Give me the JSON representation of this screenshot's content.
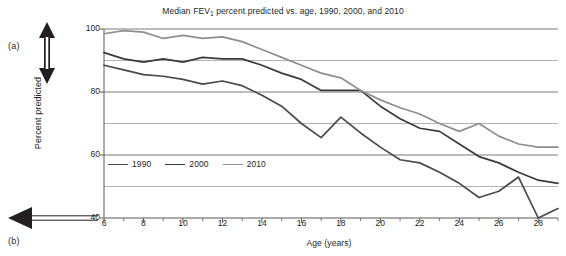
{
  "figure": {
    "panel_labels": [
      {
        "name": "a",
        "text": "(a)",
        "arrow": "vertical-double-arrow"
      },
      {
        "name": "b",
        "text": "(b)",
        "arrow": "left-arrow"
      }
    ]
  },
  "chart_data": {
    "type": "line",
    "title": "Median FEV1 percent predicted vs. age, 1990, 2000, and 2010",
    "title_main": "Median FEV",
    "title_sub": "1",
    "title_rest": " percent predicted vs. age, 1990, 2000, and 2010",
    "xlabel": "Age (years)",
    "ylabel": "Percent predicted",
    "xlim": [
      6,
      29
    ],
    "ylim": [
      40,
      100
    ],
    "xticks": [
      6,
      8,
      10,
      12,
      14,
      16,
      18,
      20,
      22,
      24,
      26,
      28
    ],
    "xtick_labels": [
      "6",
      "8",
      "10",
      "12",
      "14",
      "16",
      "18",
      "20",
      "22",
      "24",
      "26",
      "28"
    ],
    "xtick_minor": [
      7,
      9,
      11,
      13,
      15,
      17,
      19,
      21,
      23,
      25,
      27,
      29
    ],
    "yticks": [
      40,
      60,
      80,
      100
    ],
    "ytick_labels": [
      "40",
      "60",
      "80",
      "100"
    ],
    "gridlines_y": [
      50,
      60,
      70,
      80,
      90,
      100
    ],
    "grid": true,
    "legend_position": "inside-lower-left",
    "x": [
      6,
      7,
      8,
      9,
      10,
      11,
      12,
      13,
      14,
      15,
      16,
      17,
      18,
      19,
      20,
      21,
      22,
      23,
      24,
      25,
      26,
      27,
      28,
      29
    ],
    "series": [
      {
        "name": "1990",
        "label": "1990",
        "color": "#4a4a4a",
        "values": [
          88.5,
          87.0,
          85.5,
          85.0,
          84.0,
          82.5,
          83.5,
          82.0,
          79.0,
          75.5,
          70.0,
          65.5,
          72.0,
          67.0,
          62.5,
          58.5,
          57.5,
          54.5,
          51.0,
          46.5,
          48.5,
          53.0,
          40.0,
          43.0
        ]
      },
      {
        "name": "2000",
        "label": "2000",
        "color": "#3a3a3a",
        "values": [
          92.5,
          90.5,
          89.5,
          90.5,
          89.5,
          91.0,
          90.5,
          90.5,
          88.5,
          86.0,
          84.0,
          80.5,
          80.5,
          80.5,
          75.5,
          71.5,
          68.5,
          67.5,
          63.5,
          59.5,
          57.5,
          54.5,
          52.0,
          51.0
        ]
      },
      {
        "name": "2010",
        "label": "2010",
        "color": "#8e8e8e",
        "values": [
          98.5,
          99.5,
          99.0,
          97.0,
          98.0,
          97.0,
          97.5,
          96.0,
          93.5,
          91.0,
          88.5,
          86.0,
          84.5,
          80.5,
          77.5,
          75.0,
          73.0,
          70.0,
          67.5,
          70.0,
          66.0,
          63.5,
          62.5,
          62.5
        ]
      }
    ]
  }
}
